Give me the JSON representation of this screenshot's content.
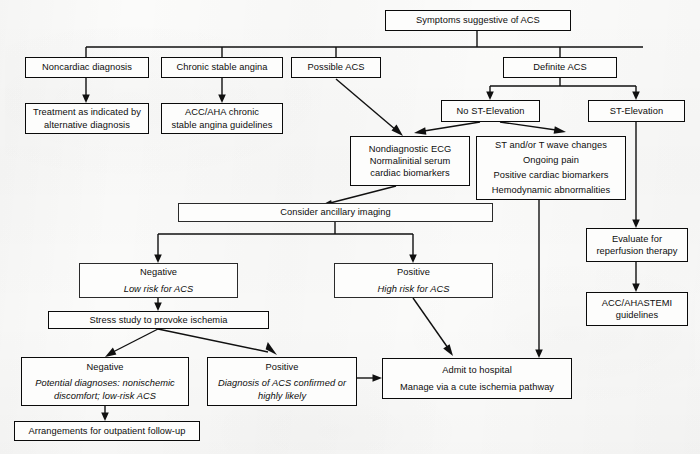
{
  "diagram": {
    "type": "flowchart",
    "background_color": "#fbfbfa",
    "line_color": "#101010",
    "text_color": "#0d0d0d"
  },
  "nodes": {
    "symptoms": {
      "line1": "Symptoms suggestive of ACS"
    },
    "noncardiac": {
      "line1": "Noncardiac diagnosis"
    },
    "treatment_alt": {
      "line1": "Treatment as indicated by",
      "line2": "alternative diagnosis"
    },
    "chronic_angina": {
      "line1": "Chronic stable angina"
    },
    "acc_aha_angina": {
      "line1": "ACC/AHA chronic",
      "line2": "stable angina guidelines"
    },
    "possible_acs": {
      "line1": "Possible ACS"
    },
    "definite_acs": {
      "line1": "Definite ACS"
    },
    "no_st_elevation": {
      "line1": "No ST-Elevation"
    },
    "st_elevation": {
      "line1": "ST-Elevation"
    },
    "nondiagnostic_ecg": {
      "line1": "Nondiagnostic ECG",
      "line2": "Normalinitial serum",
      "line3": "cardiac biomarkers"
    },
    "st_t_changes": {
      "line1": "ST and/or T wave changes",
      "line2": "Ongoing pain",
      "line3": "Positive cardiac biomarkers",
      "line4": "Hemodynamic abnormalities"
    },
    "ancillary_imaging": {
      "line1": "Consider ancillary imaging"
    },
    "imaging_negative": {
      "line1": "Negative",
      "line2": "Low risk for ACS"
    },
    "imaging_positive": {
      "line1": "Positive",
      "line2": "High risk for ACS"
    },
    "stress_study": {
      "line1": "Stress study to provoke ischemia"
    },
    "stress_negative": {
      "line1": "Negative",
      "line2": "Potential diagnoses: nonischemic",
      "line3": "discomfort; low-risk ACS"
    },
    "stress_positive": {
      "line1": "Positive",
      "line2": "Diagnosis of ACS confirmed or",
      "line3": "highly likely"
    },
    "outpatient_followup": {
      "line1": "Arrangements for outpatient follow-up"
    },
    "admit": {
      "line1": "Admit to hospital",
      "line2": "Manage via a cute ischemia pathway"
    },
    "evaluate_reperfusion": {
      "line1": "Evaluate for",
      "line2": "reperfusion therapy"
    },
    "acc_aha_stemi": {
      "line1": "ACC/AHASTEMI",
      "line2": "guidelines"
    }
  }
}
